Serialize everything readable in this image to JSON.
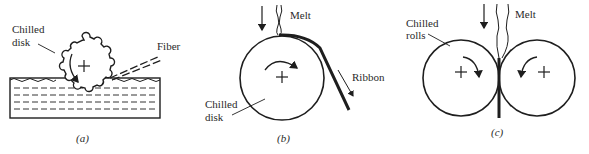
{
  "figure": {
    "panels": [
      {
        "id": "a",
        "caption": "(a)",
        "labels": {
          "disk_line1": "Chilled",
          "disk_line2": "disk",
          "fiber": "Fiber"
        },
        "components": [
          "chilled-disk-gear",
          "liquid-bath",
          "fiber-stream",
          "rotation-arrow"
        ]
      },
      {
        "id": "b",
        "caption": "(b)",
        "labels": {
          "melt": "Melt",
          "ribbon": "Ribbon",
          "disk_line1": "Chilled",
          "disk_line2": "disk"
        },
        "components": [
          "chilled-disk",
          "melt-stream",
          "ribbon",
          "rotation-arrow",
          "feed-arrow"
        ]
      },
      {
        "id": "c",
        "caption": "(c)",
        "labels": {
          "melt": "Melt",
          "rolls_line1": "Chilled",
          "rolls_line2": "rolls"
        },
        "components": [
          "left-chilled-roll",
          "right-chilled-roll",
          "melt-stream",
          "rotation-arrows",
          "feed-arrow"
        ]
      }
    ],
    "colors": {
      "ink": "#1e1e1e",
      "background": "#ffffff"
    }
  }
}
